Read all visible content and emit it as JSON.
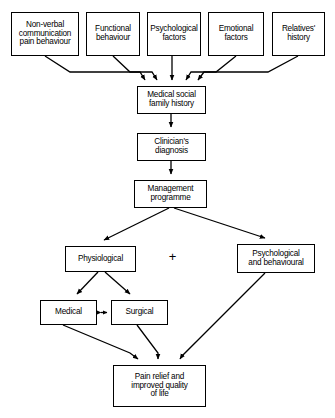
{
  "diagram": {
    "type": "flowchart",
    "background_color": "#ffffff",
    "line_color": "#000000",
    "text_color": "#000000",
    "operator": "+",
    "nodes": [
      {
        "id": "non-verbal-communication",
        "label": "Non-verbal\ncommunication\npain behaviour",
        "x": 11,
        "y": 12,
        "w": 68,
        "h": 44,
        "font_size": 8.2
      },
      {
        "id": "functional-behaviour",
        "label": "Functional\nbehaviour",
        "x": 86,
        "y": 12,
        "w": 54,
        "h": 44,
        "font_size": 8.2
      },
      {
        "id": "psychological-factors",
        "label": "Psychological\nfactors",
        "x": 147,
        "y": 12,
        "w": 54,
        "h": 44,
        "font_size": 8.2
      },
      {
        "id": "emotional-factors",
        "label": "Emotional\nfactors",
        "x": 208,
        "y": 12,
        "w": 56,
        "h": 44,
        "font_size": 8.2
      },
      {
        "id": "relatives-history",
        "label": "Relatives'\nhistory",
        "x": 272,
        "y": 12,
        "w": 53,
        "h": 44,
        "font_size": 8.2
      },
      {
        "id": "medical-social-family-history",
        "label": "Medical social\nfamily history",
        "x": 137,
        "y": 86,
        "w": 69,
        "h": 28,
        "font_size": 8.2
      },
      {
        "id": "clinicians-diagnosis",
        "label": "Clinician's\ndiagnosis",
        "x": 137,
        "y": 133,
        "w": 69,
        "h": 28,
        "font_size": 8.2
      },
      {
        "id": "management-programme",
        "label": "Management\nprogramme",
        "x": 134,
        "y": 180,
        "w": 73,
        "h": 28,
        "font_size": 8.2
      },
      {
        "id": "physiological",
        "label": "Physiological",
        "x": 65,
        "y": 246,
        "w": 71,
        "h": 26,
        "font_size": 8.2
      },
      {
        "id": "psychological-and-behavioural",
        "label": "Psychological\nand behavioural",
        "x": 237,
        "y": 244,
        "w": 78,
        "h": 29,
        "font_size": 8.2
      },
      {
        "id": "medical",
        "label": "Medical",
        "x": 40,
        "y": 300,
        "w": 57,
        "h": 25,
        "font_size": 8.2
      },
      {
        "id": "surgical",
        "label": "Surgical",
        "x": 111,
        "y": 300,
        "w": 57,
        "h": 25,
        "font_size": 8.2
      },
      {
        "id": "pain-relief-outcome",
        "label": "Pain relief and\nimproved quality\nof life",
        "x": 113,
        "y": 365,
        "w": 93,
        "h": 42,
        "font_size": 8.2
      }
    ],
    "operator_position": {
      "x": 166,
      "y": 250,
      "font_size": 13
    },
    "edges": [
      {
        "from": "non-verbal-communication",
        "to": "medical-social-family-history",
        "style": "elbow"
      },
      {
        "from": "functional-behaviour",
        "to": "medical-social-family-history",
        "style": "elbow"
      },
      {
        "from": "psychological-factors",
        "to": "medical-social-family-history",
        "style": "straight"
      },
      {
        "from": "emotional-factors",
        "to": "medical-social-family-history",
        "style": "elbow"
      },
      {
        "from": "relatives-history",
        "to": "medical-social-family-history",
        "style": "elbow"
      },
      {
        "from": "medical-social-family-history",
        "to": "clinicians-diagnosis",
        "style": "straight"
      },
      {
        "from": "clinicians-diagnosis",
        "to": "management-programme",
        "style": "straight"
      },
      {
        "from": "management-programme",
        "to": "physiological",
        "style": "diagonal"
      },
      {
        "from": "management-programme",
        "to": "psychological-and-behavioural",
        "style": "diagonal"
      },
      {
        "from": "physiological",
        "to": "medical",
        "style": "diagonal"
      },
      {
        "from": "physiological",
        "to": "surgical",
        "style": "diagonal"
      },
      {
        "from": "medical",
        "to": "surgical",
        "style": "bidirectional"
      },
      {
        "from": "medical",
        "to": "pain-relief-outcome",
        "style": "elbow"
      },
      {
        "from": "surgical",
        "to": "pain-relief-outcome",
        "style": "elbow"
      },
      {
        "from": "psychological-and-behavioural",
        "to": "pain-relief-outcome",
        "style": "diagonal"
      }
    ]
  }
}
